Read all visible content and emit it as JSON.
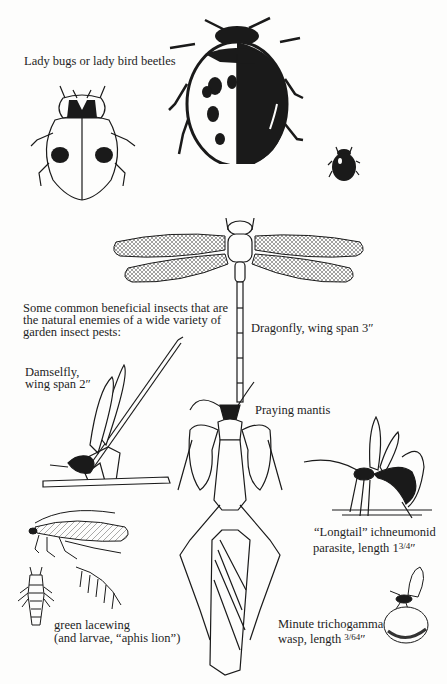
{
  "page": {
    "background": "#fdfdfc",
    "ink_color": "#1a1a1a"
  },
  "captions": {
    "ladybugs": "Lady bugs or lady bird beetles",
    "intro_line1": "Some common beneficial insects that are",
    "intro_line2": "the natural enemies of a wide variety of",
    "intro_line3": "garden insect pests:",
    "dragonfly": "Dragonfly, wing span 3″",
    "damselfly_line1": "Damselfly,",
    "damselfly_line2": "wing span 2″",
    "mantis": "Praying mantis",
    "ichneumonid_line1": "“Longtail” ichneumonid",
    "ichneumonid_line2_prefix": "parasite, length 1",
    "ichneumonid_line2_fraction": "3/4",
    "ichneumonid_line2_suffix": "″",
    "lacewing_line1": "green lacewing",
    "lacewing_line2": "(and larvae, “aphis lion”)",
    "trichogamma_line1": "Minute trichogamma",
    "trichogamma_line2_prefix": "wasp, length ",
    "trichogamma_line2_fraction": "3/64",
    "trichogamma_line2_suffix": "″"
  },
  "illustrations": [
    {
      "id": "ladybug-small-outline",
      "label": "two-spot lady beetle (outline)"
    },
    {
      "id": "ladybug-large-black",
      "label": "large spotted lady beetle"
    },
    {
      "id": "ladybug-tiny",
      "label": "tiny lady beetle"
    },
    {
      "id": "dragonfly",
      "label": "dragonfly"
    },
    {
      "id": "damselfly",
      "label": "damselfly on stem"
    },
    {
      "id": "praying-mantis",
      "label": "praying mantis"
    },
    {
      "id": "ichneumonid",
      "label": "longtail ichneumonid wasp"
    },
    {
      "id": "lacewing",
      "label": "green lacewing adult"
    },
    {
      "id": "lacewing-larva",
      "label": "aphis lion larva"
    },
    {
      "id": "trichogamma",
      "label": "trichogamma wasp on egg"
    }
  ]
}
